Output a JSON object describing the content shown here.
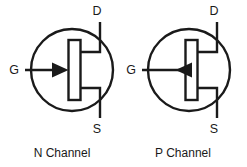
{
  "figure": {
    "background_color": "#ffffff",
    "line_color": "#1a1a1a",
    "text_color": "#1a1a1a"
  },
  "symbols": [
    {
      "id": "n-channel-jfet",
      "caption": "N Channel",
      "gate_arrow_direction": "inward",
      "terminals": {
        "drain": "D",
        "gate": "G",
        "source": "S"
      }
    },
    {
      "id": "p-channel-jfet",
      "caption": "P Channel",
      "gate_arrow_direction": "outward",
      "terminals": {
        "drain": "D",
        "gate": "G",
        "source": "S"
      }
    }
  ]
}
